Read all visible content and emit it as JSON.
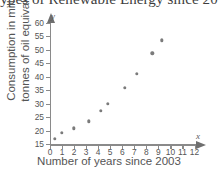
{
  "title": "ypes of Renewable Energy since 20",
  "axis_letters": {
    "y": "y",
    "x": "x"
  },
  "chart_data": {
    "type": "scatter",
    "title": "ypes of Renewable Energy since 20",
    "xlabel": "Number of years since 2003",
    "ylabel": "Consumption in million tonnes of oil equivalent",
    "ylabel_line1": "Consumption in million",
    "ylabel_line2": "tonnes of oil equivalent",
    "xlim": [
      0,
      12
    ],
    "ylim": [
      15,
      60
    ],
    "grid": false,
    "legend": null,
    "xticks": [
      0,
      1,
      2,
      3,
      4,
      5,
      6,
      7,
      8,
      9,
      10,
      11,
      12
    ],
    "yticks": [
      15,
      20,
      25,
      30,
      35,
      40,
      45,
      50,
      55,
      60
    ],
    "marker_color": "#7b7b7b",
    "x": [
      0.4,
      1.0,
      2.0,
      3.2,
      4.2,
      4.8,
      6.2,
      7.2,
      8.5,
      9.3
    ],
    "y": [
      17.0,
      19.3,
      21.0,
      23.5,
      27.5,
      30.0,
      36.0,
      41.0,
      48.7,
      53.5
    ],
    "points": [
      {
        "x": 0.4,
        "y": 17.0
      },
      {
        "x": 1.0,
        "y": 19.3
      },
      {
        "x": 2.0,
        "y": 21.0
      },
      {
        "x": 3.2,
        "y": 23.5
      },
      {
        "x": 4.2,
        "y": 27.5
      },
      {
        "x": 4.8,
        "y": 30.0
      },
      {
        "x": 6.2,
        "y": 36.0
      },
      {
        "x": 7.2,
        "y": 41.0
      },
      {
        "x": 8.5,
        "y": 48.7
      },
      {
        "x": 9.3,
        "y": 53.5
      }
    ]
  }
}
